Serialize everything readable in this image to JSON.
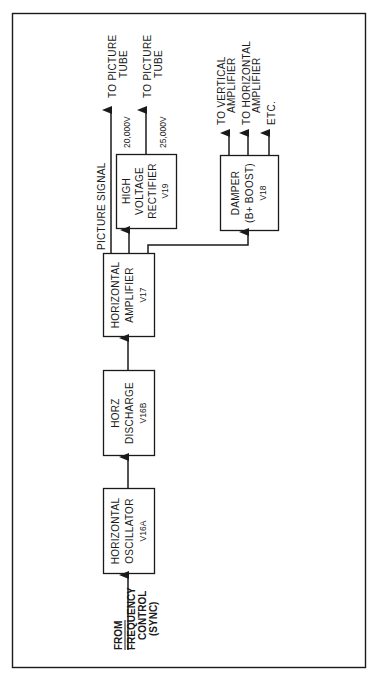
{
  "diagram": {
    "type": "block-diagram",
    "orientation": "rotated-90-ccw",
    "input": {
      "label_lines": [
        "FROM",
        "FREQUENCY",
        "CONTROL",
        "(SYNC)"
      ]
    },
    "blocks": [
      {
        "id": "osc",
        "lines": [
          "HORIZONTAL",
          "OSCILLATOR",
          "V16A"
        ]
      },
      {
        "id": "discharge",
        "lines": [
          "HORZ",
          "DISCHARGE",
          "V16B"
        ]
      },
      {
        "id": "amp",
        "lines": [
          "HORIZONTAL",
          "AMPLIFIER",
          "V17"
        ]
      },
      {
        "id": "hvr",
        "lines": [
          "HIGH",
          "VOLTAGE",
          "RECTIFIER",
          "V19"
        ]
      },
      {
        "id": "damper",
        "lines": [
          "DAMPER",
          "(B+ BOOST)",
          "V18"
        ]
      }
    ],
    "signals": {
      "picture_signal": "PICTURE SIGNAL",
      "v20000": "20,000V",
      "v25000": "25,000V"
    },
    "outputs": {
      "picture_tube_1": [
        "TO PICTURE",
        "TUBE"
      ],
      "picture_tube_2": [
        "TO PICTURE",
        "TUBE"
      ],
      "vertical_amp": [
        "TO VERTICAL",
        "AMPLIFIER"
      ],
      "horizontal_amp": [
        "TO HORIZONTAL",
        "AMPLIFIER"
      ],
      "etc": [
        "ETC."
      ]
    },
    "connections": [
      [
        "input",
        "osc"
      ],
      [
        "osc",
        "discharge"
      ],
      [
        "discharge",
        "amp"
      ],
      [
        "amp",
        "picture_tube_1"
      ],
      [
        "amp",
        "hvr"
      ],
      [
        "amp",
        "damper"
      ],
      [
        "hvr",
        "picture_tube_2"
      ],
      [
        "damper",
        "vertical_amp"
      ],
      [
        "damper",
        "horizontal_amp"
      ],
      [
        "damper",
        "etc"
      ]
    ],
    "colors": {
      "ink": "#1a1a1a",
      "paper": "#ffffff"
    }
  }
}
